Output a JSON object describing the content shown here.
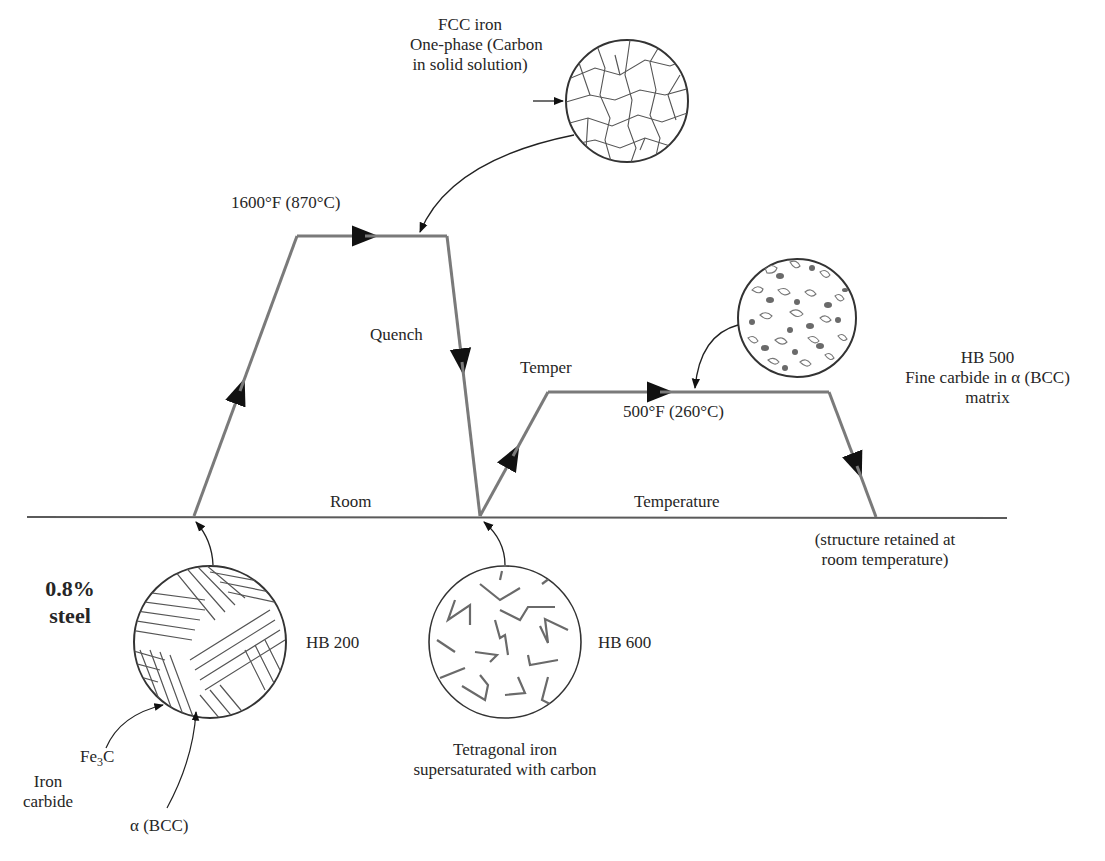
{
  "diagram": {
    "title_hidden": "Heat treatment of 0.8% carbon steel (quench and temper)",
    "steel_label_line1": "0.8%",
    "steel_label_line2": "steel",
    "heating": {
      "temperature_label": "1600°F (870°C)",
      "fcc_label_line1": "FCC iron",
      "fcc_label_line2": "One-phase (Carbon",
      "fcc_label_line3": "in solid solution)"
    },
    "quench_label": "Quench",
    "room_label": "Room",
    "temperature_axis_label": "Temperature",
    "temper": {
      "label": "Temper",
      "temperature_label": "500°F (260°C)",
      "hardness": "HB 500",
      "structure_line1": "Fine carbide in α (BCC)",
      "structure_line2": "matrix",
      "retained_line1": "(structure retained at",
      "retained_line2": "room temperature)"
    },
    "initial": {
      "hardness": "HB 200",
      "fe3c_label": "Fe",
      "fe3c_sub": "3",
      "fe3c_tail": "C",
      "iron_carbide_line1": "Iron",
      "iron_carbide_line2": "carbide",
      "alpha_label": "α (BCC)"
    },
    "quenched": {
      "hardness": "HB 600",
      "structure_line1": "Tetragonal iron",
      "structure_line2": "supersaturated with carbon"
    },
    "colors": {
      "path": "#7a7a7a",
      "baseline": "#5a5a5a",
      "ink": "#262626",
      "carbide_fill": "#6a6a6a"
    }
  }
}
